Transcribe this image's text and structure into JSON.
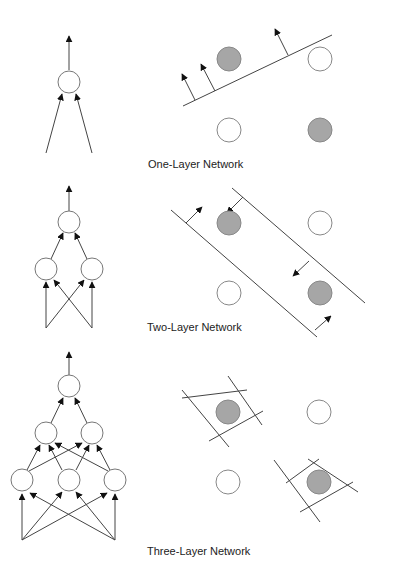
{
  "colors": {
    "stroke": "#333333",
    "node_fill": "#ffffff",
    "node_stroke": "#777777",
    "class_filled": "#a6a6a6",
    "class_empty": "#ffffff"
  },
  "panels": [
    {
      "id": "one-layer",
      "label": "One-Layer Network",
      "network": {
        "layers": [
          {
            "name": "output",
            "nodes": 1
          }
        ],
        "inputs": 2
      },
      "decision": {
        "type": "single-hyperplane",
        "points": [
          {
            "pos": "top-left",
            "class": "filled"
          },
          {
            "pos": "top-right",
            "class": "empty"
          },
          {
            "pos": "bottom-left",
            "class": "empty"
          },
          {
            "pos": "bottom-right",
            "class": "filled"
          }
        ]
      }
    },
    {
      "id": "two-layer",
      "label": "Two-Layer Network",
      "network": {
        "layers": [
          {
            "name": "hidden",
            "nodes": 2
          },
          {
            "name": "output",
            "nodes": 1
          }
        ],
        "inputs": 2
      },
      "decision": {
        "type": "two-parallel-hyperplanes (band)",
        "points": [
          {
            "pos": "top-left",
            "class": "filled"
          },
          {
            "pos": "top-right",
            "class": "empty"
          },
          {
            "pos": "bottom-left",
            "class": "empty"
          },
          {
            "pos": "bottom-right",
            "class": "filled"
          }
        ]
      }
    },
    {
      "id": "three-layer",
      "label": "Three-Layer Network",
      "network": {
        "layers": [
          {
            "name": "hidden-1",
            "nodes": 3
          },
          {
            "name": "hidden-2",
            "nodes": 2
          },
          {
            "name": "output",
            "nodes": 1
          }
        ],
        "inputs": 2
      },
      "decision": {
        "type": "enclosed convex regions",
        "points": [
          {
            "pos": "top-left",
            "class": "filled"
          },
          {
            "pos": "top-right",
            "class": "empty"
          },
          {
            "pos": "bottom-left",
            "class": "empty"
          },
          {
            "pos": "bottom-right",
            "class": "filled"
          }
        ]
      }
    }
  ]
}
